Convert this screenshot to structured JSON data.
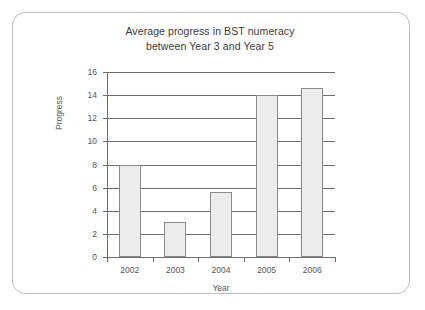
{
  "chart_data": {
    "type": "bar",
    "title": "Average progress in BST numeracy between Year 3 and Year 5",
    "title_lines": [
      "Average progress in BST numeracy",
      "between Year 3 and Year 5"
    ],
    "categories": [
      "2002",
      "2003",
      "2004",
      "2005",
      "2006"
    ],
    "values": [
      8,
      3,
      5.6,
      14,
      14.6
    ],
    "xlabel": "Year",
    "ylabel": "Progress",
    "ylim": [
      0,
      16
    ],
    "ytick_labels": [
      "0",
      "2",
      "4",
      "6",
      "8",
      "10",
      "12",
      "14",
      "16"
    ],
    "ytick_values": [
      0,
      2,
      4,
      6,
      8,
      10,
      12,
      14,
      16
    ],
    "grid": true,
    "legend": false,
    "bar_fill": "#ececec",
    "bar_edge": "#8a8a8a",
    "axis_color": "#6e6e6e",
    "text_color": "#555555",
    "title_color": "#3a3a3a",
    "frame_color": "#bdbdbd",
    "background": "#ffffff"
  }
}
